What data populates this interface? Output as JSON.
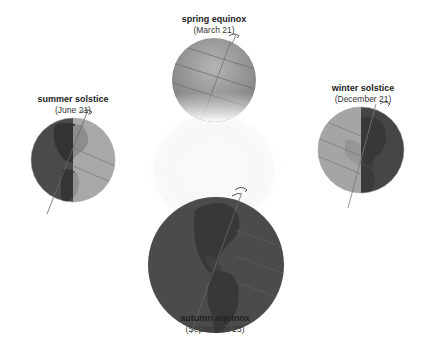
{
  "diagram": {
    "center": {
      "name": "sun",
      "style": "white radial glow"
    },
    "positions": [
      {
        "id": "spring",
        "title": "spring equinox",
        "date": "(March 21)",
        "shading": "partial, lit from below"
      },
      {
        "id": "summer",
        "title": "summer solstice",
        "date": "(June 21)",
        "shading": "left half dark, right half lit"
      },
      {
        "id": "winter",
        "title": "winter solstice",
        "date": "(December 21)",
        "shading": "left half lit, right half dark"
      },
      {
        "id": "autumn",
        "title": "autumn equinox",
        "date": "(September 23)",
        "shading": "fully dark, facing away"
      }
    ],
    "colors": {
      "background": "#ffffff",
      "dark_side": "#4a4a4a",
      "lit_side": "#a8a8a8",
      "land_dark": "#333333",
      "land_lit": "#8c8c8c",
      "text": "#222222"
    }
  }
}
